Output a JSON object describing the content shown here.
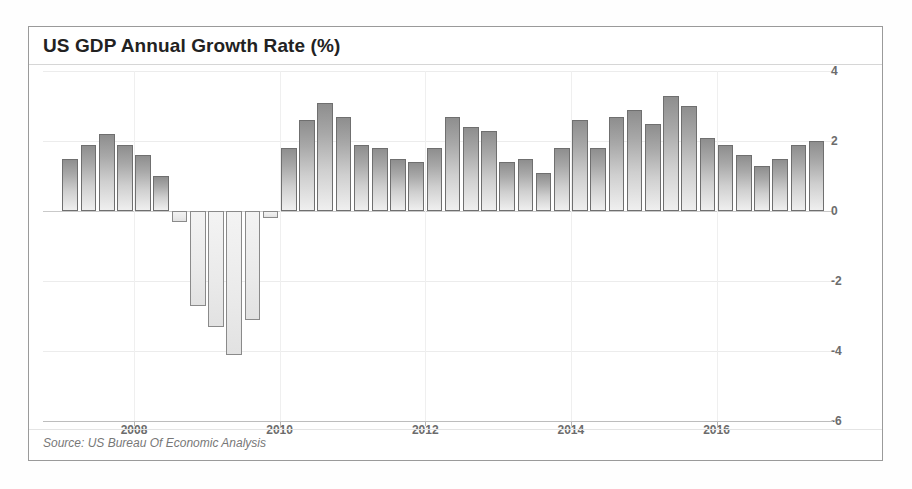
{
  "chart_data": {
    "type": "bar",
    "title": "US GDP Annual Growth Rate (%)",
    "source": "Source: US Bureau Of Economic Analysis",
    "xlabel": "",
    "ylabel": "",
    "ylim": [
      -6,
      4
    ],
    "yticks": [
      4,
      2,
      0,
      -2,
      -4,
      -6
    ],
    "ytick_labels": [
      "4",
      "2",
      "0",
      "-2",
      "-4",
      "-6"
    ],
    "xticks": [
      2008,
      2010,
      2012,
      2014,
      2016
    ],
    "xtick_labels": [
      "2008",
      "2010",
      "2012",
      "2014",
      "2016"
    ],
    "grid": true,
    "legend": "none",
    "bar_color_positive": "#a8a8a8",
    "bar_color_negative": "#eeeeee",
    "bar_border_color": "#6f6f6f",
    "categories": [
      "2007 Q1",
      "2007 Q2",
      "2007 Q3",
      "2007 Q4",
      "2008 Q1",
      "2008 Q2",
      "2008 Q3",
      "2008 Q4",
      "2009 Q1",
      "2009 Q2",
      "2009 Q3",
      "2009 Q4",
      "2010 Q1",
      "2010 Q2",
      "2010 Q3",
      "2010 Q4",
      "2011 Q1",
      "2011 Q2",
      "2011 Q3",
      "2011 Q4",
      "2012 Q1",
      "2012 Q2",
      "2012 Q3",
      "2012 Q4",
      "2013 Q1",
      "2013 Q2",
      "2013 Q3",
      "2013 Q4",
      "2014 Q1",
      "2014 Q2",
      "2014 Q3",
      "2014 Q4",
      "2015 Q1",
      "2015 Q2",
      "2015 Q3",
      "2015 Q4",
      "2016 Q1",
      "2016 Q2",
      "2016 Q3",
      "2016 Q4",
      "2017 Q1",
      "2017 Q2"
    ],
    "values": [
      1.5,
      1.9,
      2.2,
      1.9,
      1.6,
      1.0,
      -0.3,
      -2.7,
      -3.3,
      -4.1,
      -3.1,
      -0.2,
      1.8,
      2.6,
      3.1,
      2.7,
      1.9,
      1.8,
      1.5,
      1.4,
      1.8,
      2.7,
      2.4,
      2.3,
      1.4,
      1.5,
      1.1,
      1.8,
      2.6,
      1.8,
      2.7,
      2.9,
      2.5,
      3.3,
      3.0,
      2.1,
      1.9,
      1.6,
      1.3,
      1.5,
      1.9,
      2.0
    ],
    "x_start": 2007.0,
    "x_step": 0.25
  }
}
